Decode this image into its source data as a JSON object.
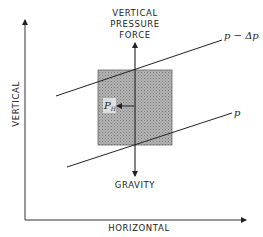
{
  "diagram": {
    "axes": {
      "x_label": "HORIZONTAL",
      "y_label": "VERTICAL"
    },
    "forces": {
      "up_label_line1": "VERTICAL",
      "up_label_line2": "PRESSURE",
      "up_label_line3": "FORCE",
      "down_label": "GRAVITY"
    },
    "horizontal_pressure_force": {
      "symbol": "P",
      "subscript": "H"
    },
    "isobars": [
      {
        "label": "p − Δp"
      },
      {
        "label": "p"
      }
    ],
    "colors": {
      "ink": "#222222",
      "parcel_fill": "#a8a8a8",
      "background": "#ffffff"
    }
  }
}
